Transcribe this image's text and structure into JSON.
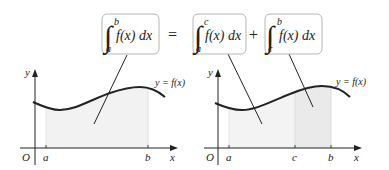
{
  "equation": {
    "lhs": {
      "lower": "a",
      "upper": "b",
      "integrand": "f(x) dx"
    },
    "equals": "=",
    "rhs1": {
      "lower": "a",
      "upper": "c",
      "integrand": "f(x) dx"
    },
    "plus": "+",
    "rhs2": {
      "lower": "c",
      "upper": "b",
      "integrand": "f(x) dx"
    }
  },
  "left_graph": {
    "origin_label": "O",
    "x_axis_label": "x",
    "y_axis_label": "y",
    "curve_label": "y = f(x)",
    "ticks": [
      "a",
      "b"
    ]
  },
  "right_graph": {
    "origin_label": "O",
    "x_axis_label": "x",
    "y_axis_label": "y",
    "curve_label": "y = f(x)",
    "ticks": [
      "a",
      "c",
      "b"
    ]
  },
  "colors": {
    "stroke": "#222222",
    "box_border": "#b5b5b5",
    "fill_region": "#f1f1f1",
    "fill_region_dark": "#e8e8e8"
  }
}
